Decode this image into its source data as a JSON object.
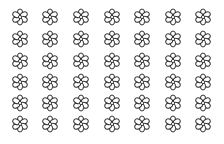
{
  "canvas": {
    "width": 224,
    "height": 144,
    "background": "#ffffff"
  },
  "grid": {
    "rows": 6,
    "columns": 7,
    "icon": "flower-outline-icon",
    "petals": 6,
    "stroke_color": "#333333",
    "fill_color": "#ffffff",
    "icon_size": 18,
    "column_centers": [
      20,
      50,
      81,
      112,
      142,
      173,
      203
    ],
    "row_centers": [
      17,
      39,
      61,
      82,
      103,
      124
    ]
  }
}
